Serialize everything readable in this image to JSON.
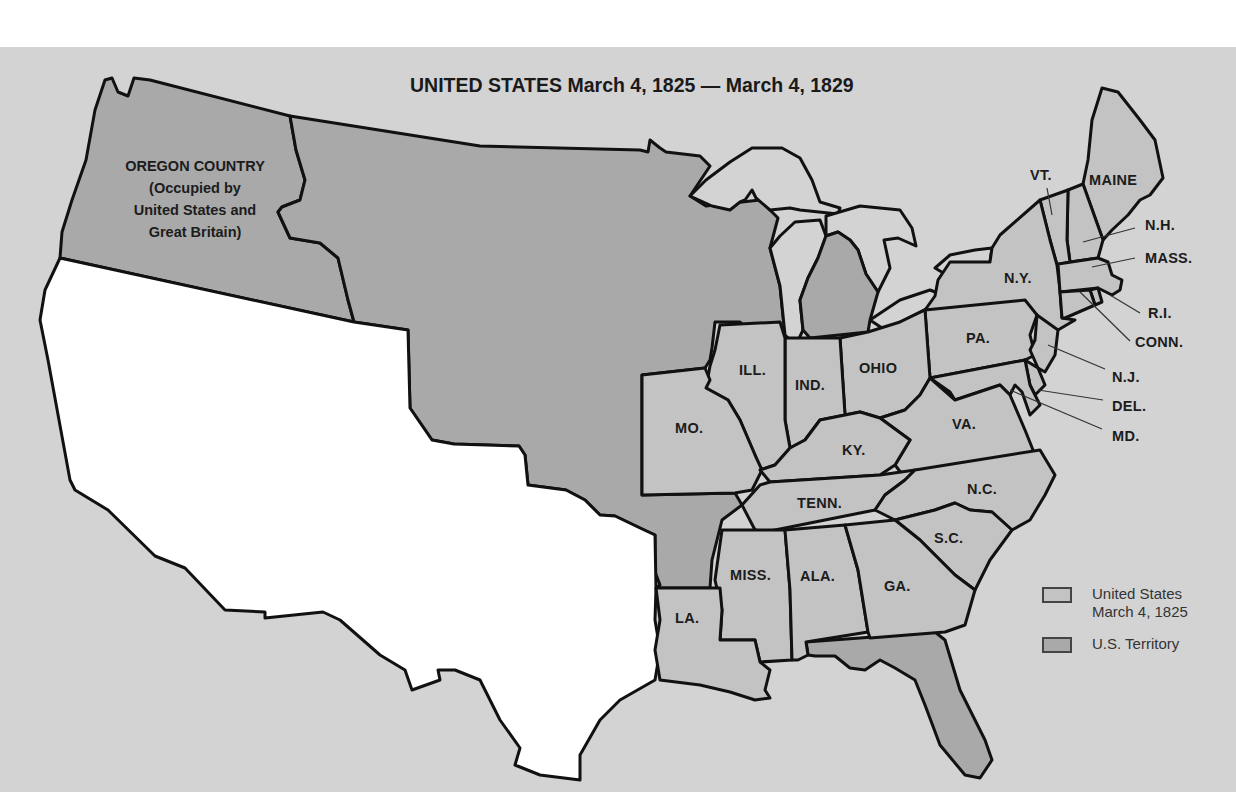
{
  "title": {
    "bold": "UNITED STATES",
    "dates": "March 4, 1825 — March 4, 1829"
  },
  "regions": {
    "oregon_country": {
      "name": "OREGON COUNTRY",
      "lines": [
        "(Occupied by",
        "United States and",
        "Great Britain)"
      ]
    }
  },
  "states": [
    {
      "id": "vt",
      "label": "VT."
    },
    {
      "id": "maine",
      "label": "MAINE"
    },
    {
      "id": "nh",
      "label": "N.H."
    },
    {
      "id": "mass",
      "label": "MASS."
    },
    {
      "id": "ny",
      "label": "N.Y."
    },
    {
      "id": "ri",
      "label": "R.I."
    },
    {
      "id": "conn",
      "label": "CONN."
    },
    {
      "id": "pa",
      "label": "PA."
    },
    {
      "id": "nj",
      "label": "N.J."
    },
    {
      "id": "del",
      "label": "DEL."
    },
    {
      "id": "md",
      "label": "MD."
    },
    {
      "id": "ohio",
      "label": "OHIO"
    },
    {
      "id": "ill",
      "label": "ILL."
    },
    {
      "id": "ind",
      "label": "IND."
    },
    {
      "id": "mo",
      "label": "MO."
    },
    {
      "id": "ky",
      "label": "KY."
    },
    {
      "id": "va",
      "label": "VA."
    },
    {
      "id": "tenn",
      "label": "TENN."
    },
    {
      "id": "nc",
      "label": "N.C."
    },
    {
      "id": "sc",
      "label": "S.C."
    },
    {
      "id": "miss",
      "label": "MISS."
    },
    {
      "id": "ala",
      "label": "ALA."
    },
    {
      "id": "ga",
      "label": "GA."
    },
    {
      "id": "la",
      "label": "LA."
    }
  ],
  "legend": {
    "items": [
      {
        "label_line1": "United States",
        "label_line2": "March 4, 1825",
        "color": "#c3c3c3"
      },
      {
        "label_line1": "U.S. Territory",
        "label_line2": "",
        "color": "#a9a9a9"
      }
    ]
  },
  "colors": {
    "background": "#d3d3d3",
    "states": "#c3c3c3",
    "territory": "#a9a9a9",
    "foreign": "#ffffff",
    "border": "#111111"
  }
}
